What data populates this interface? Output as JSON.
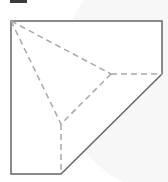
{
  "diagram": {
    "colors": {
      "outline": "#666666",
      "crease": "#a8a8a8",
      "fill": "#ffffff",
      "background_blob": "#f7f7f7",
      "top_bar": "#3a3a3a"
    },
    "outline_points": "11,21 162,21 162,74 61,174 11,174",
    "creases": [
      {
        "x1": 11,
        "y1": 21,
        "x2": 111,
        "y2": 74
      },
      {
        "x1": 111,
        "y1": 74,
        "x2": 162,
        "y2": 74
      },
      {
        "x1": 11,
        "y1": 21,
        "x2": 61,
        "y2": 124
      },
      {
        "x1": 61,
        "y1": 124,
        "x2": 61,
        "y2": 174
      },
      {
        "x1": 111,
        "y1": 74,
        "x2": 61,
        "y2": 124
      }
    ]
  }
}
